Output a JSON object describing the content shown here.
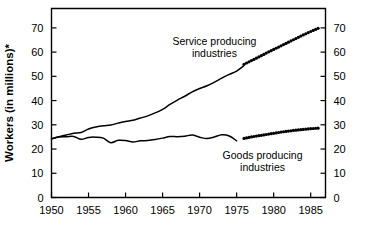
{
  "chart_data": {
    "type": "line",
    "title": "",
    "xlabel": "",
    "ylabel": "Workers (in millions)*",
    "ylim": [
      0,
      78
    ],
    "xlim": [
      1950,
      1987
    ],
    "grid": false,
    "legend_position": "inline-annotations",
    "y_ticks": [
      0,
      10,
      20,
      30,
      40,
      50,
      60,
      70
    ],
    "y_tick_labels": [
      "0",
      "10",
      "20",
      "30",
      "40",
      "50",
      "60",
      "70"
    ],
    "y_axis_right_labels": [
      "0",
      "10",
      "20",
      "30",
      "40",
      "50",
      "60",
      "70"
    ],
    "x_ticks": [
      1950,
      1955,
      1960,
      1965,
      1970,
      1975,
      1980,
      1985
    ],
    "x_tick_labels": [
      "1950",
      "1955",
      "1960",
      "1965",
      "1970",
      "1975",
      "1980",
      "1985"
    ],
    "annotations": [
      {
        "text_line1": "Service producing",
        "text_line2": "industries",
        "x": 1972,
        "y": 63
      },
      {
        "text_line1": "Goods producing",
        "text_line2": "industries",
        "x": 1978.5,
        "y": 16
      }
    ],
    "series": [
      {
        "name": "Service producing industries",
        "style": "solid-then-dotted",
        "x": [
          1950,
          1951,
          1952,
          1953,
          1954,
          1955,
          1956,
          1957,
          1958,
          1959,
          1960,
          1961,
          1962,
          1963,
          1964,
          1965,
          1966,
          1967,
          1968,
          1969,
          1970,
          1971,
          1972,
          1973,
          1974,
          1975,
          1976
        ],
        "values": [
          24.3,
          25.1,
          25.8,
          26.5,
          26.8,
          28.3,
          29.1,
          29.6,
          29.9,
          30.7,
          31.4,
          31.9,
          32.8,
          33.7,
          34.9,
          36.4,
          38.4,
          40.2,
          41.8,
          43.6,
          45.0,
          46.1,
          47.6,
          49.3,
          50.8,
          52.2,
          54.5
        ],
        "projection_x": [
          1976,
          1977,
          1978,
          1979,
          1980,
          1981,
          1982,
          1983,
          1984,
          1985,
          1986
        ],
        "projection_values": [
          55.0,
          56.5,
          58.0,
          59.6,
          61.1,
          62.6,
          64.1,
          65.6,
          67.1,
          68.5,
          69.8
        ],
        "projection_style": "dotted"
      },
      {
        "name": "Goods producing industries",
        "style": "solid-then-dotted",
        "x": [
          1950,
          1951,
          1952,
          1953,
          1954,
          1955,
          1956,
          1957,
          1958,
          1959,
          1960,
          1961,
          1962,
          1963,
          1964,
          1965,
          1966,
          1967,
          1968,
          1969,
          1970,
          1971,
          1972,
          1973,
          1974,
          1975
        ],
        "values": [
          24.1,
          25.0,
          25.1,
          25.2,
          24.0,
          24.8,
          24.9,
          24.5,
          22.6,
          23.6,
          23.5,
          22.9,
          23.4,
          23.5,
          23.9,
          24.5,
          25.2,
          25.1,
          25.3,
          25.8,
          24.9,
          24.3,
          25.0,
          25.9,
          25.4,
          23.4
        ],
        "projection_x": [
          1976,
          1977,
          1978,
          1979,
          1980,
          1981,
          1982,
          1983,
          1984,
          1985,
          1986
        ],
        "projection_values": [
          24.4,
          25.0,
          25.5,
          26.0,
          26.5,
          27.0,
          27.4,
          27.8,
          28.1,
          28.4,
          28.6
        ],
        "projection_style": "dotted"
      }
    ]
  },
  "axis": {
    "y_title": "Workers (in millions)*"
  }
}
